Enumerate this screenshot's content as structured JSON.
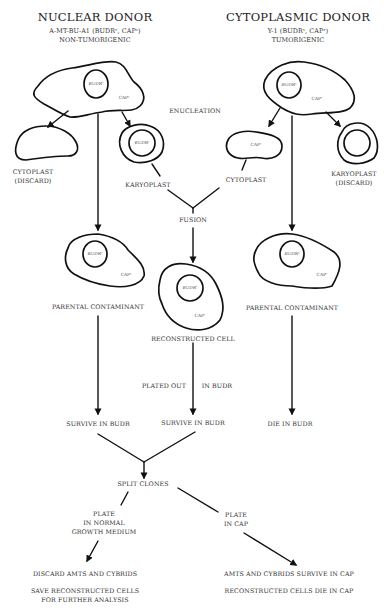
{
  "nuclear_donor": {
    "title": "NUCLEAR DONOR",
    "strain": "A-MT-BU-A1 (BUDRʳ, CAPˢ)",
    "phenotype": "NON-TUMORIGENIC",
    "nucleus_label": "BUDRʳ",
    "cytoplasm_label": "CAPˢ"
  },
  "cytoplasmic_donor": {
    "title": "CYTOPLASMIC DONOR",
    "strain": "Y-1 (BUDRˢ, CAPʳ)",
    "phenotype": "TUMORIGENIC",
    "nucleus_label": "BUDRˢ",
    "cytoplasm_label": "CAPʳ"
  },
  "enucleation_label": "ENUCLEATION",
  "left_cytoplast": {
    "line1": "CYTOPLAST",
    "line2": "(DISCARD)"
  },
  "left_karyoplast": {
    "label": "KARYOPLAST",
    "nucleus_label": "BUDRʳ"
  },
  "right_cytoplast": {
    "label": "CYTOPLAST",
    "cytoplasm_label": "CAPʳ"
  },
  "right_karyoplast": {
    "line1": "KARYOPLAST",
    "line2": "(DISCARD)"
  },
  "fusion_label": "FUSION",
  "left_parental": {
    "label": "PARENTAL CONTAMINANT",
    "nucleus_label": "BUDRʳ",
    "cytoplasm_label": "CAPˢ"
  },
  "right_parental": {
    "label": "PARENTAL CONTAMINANT",
    "nucleus_label": "BUDRˢ",
    "cytoplasm_label": "CAPʳ"
  },
  "reconstructed": {
    "label": "RECONSTRUCTED CELL",
    "nucleus_label": "BUDRʳ",
    "cytoplasm_label": "CAPʳ"
  },
  "plated_out": {
    "left": "PLATED OUT",
    "right": "IN BUDR"
  },
  "outcomes_budr": {
    "left": "SURVIVE IN BUDR",
    "middle": "SURVIVE IN BUDR",
    "right": "DIE IN BUDR"
  },
  "split_clones_label": "SPLIT CLONES",
  "plate_normal": {
    "line1": "PLATE",
    "line2": "IN NORMAL",
    "line3": "GROWTH MEDIUM"
  },
  "plate_cap": {
    "line1": "PLATE",
    "line2": "IN CAP"
  },
  "result_normal": {
    "line1": "DISCARD AMTS AND CYBRIDS",
    "line2": "SAVE RECONSTRUCTED CELLS",
    "line3": "FOR FURTHER ANALYSIS"
  },
  "result_cap": {
    "line1": "AMTS AND CYBRIDS SURVIVE IN CAP",
    "line2": "RECONSTRUCTED CELLS DIE IN CAP"
  }
}
